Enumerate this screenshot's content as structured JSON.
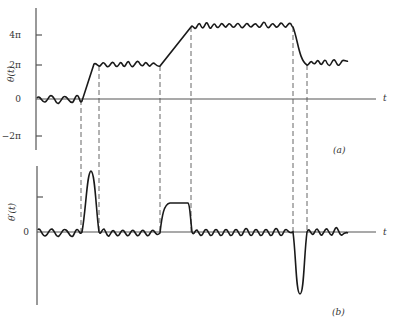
{
  "figure": {
    "panel_a": {
      "ylabel": "θ(t)",
      "xlabel": "t",
      "caption": "(a)",
      "yticks": [
        "4π",
        "2π",
        "0",
        "−2π"
      ]
    },
    "panel_b": {
      "ylabel": "θ′(t)",
      "xlabel": "t",
      "caption": "(b)",
      "yticks": [
        "0"
      ]
    }
  },
  "colors": {
    "curve": "#1a1a1a",
    "axis": "#555555",
    "dash": "#555555"
  }
}
